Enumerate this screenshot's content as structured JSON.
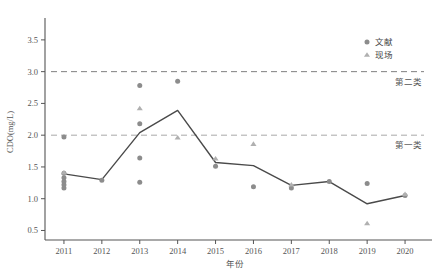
{
  "chart_data": {
    "type": "scatter",
    "title": "",
    "xlabel": "年份",
    "ylabel": "CDO(mg/L)",
    "categories": [
      "2011",
      "2012",
      "2013",
      "2014",
      "2015",
      "2016",
      "2017",
      "2018",
      "2019",
      "2020"
    ],
    "ylim": [
      0.35,
      3.75
    ],
    "yticks": [
      0.5,
      1.0,
      1.5,
      2.0,
      2.5,
      3.0,
      3.5
    ],
    "ytick_labels": [
      "0.5",
      "1.0",
      "1.5",
      "2.0",
      "2.5",
      "3.0",
      "3.5"
    ],
    "grid": false,
    "legend_position": "top-right",
    "series": [
      {
        "name": "文献",
        "marker": "circle",
        "color": "#8c8c8c",
        "points": [
          {
            "x": "2011",
            "y": 1.97
          },
          {
            "x": "2011",
            "y": 1.4
          },
          {
            "x": "2011",
            "y": 1.33
          },
          {
            "x": "2011",
            "y": 1.27
          },
          {
            "x": "2011",
            "y": 1.22
          },
          {
            "x": "2011",
            "y": 1.17
          },
          {
            "x": "2012",
            "y": 1.29
          },
          {
            "x": "2013",
            "y": 2.78
          },
          {
            "x": "2013",
            "y": 2.18
          },
          {
            "x": "2013",
            "y": 1.64
          },
          {
            "x": "2013",
            "y": 1.26
          },
          {
            "x": "2014",
            "y": 2.85
          },
          {
            "x": "2015",
            "y": 1.51
          },
          {
            "x": "2016",
            "y": 1.19
          },
          {
            "x": "2017",
            "y": 1.17
          },
          {
            "x": "2018",
            "y": 1.27
          },
          {
            "x": "2019",
            "y": 1.24
          },
          {
            "x": "2020",
            "y": 1.05
          }
        ]
      },
      {
        "name": "现场",
        "marker": "triangle",
        "color": "#b0b0b0",
        "points": [
          {
            "x": "2011",
            "y": 1.41
          },
          {
            "x": "2013",
            "y": 2.42
          },
          {
            "x": "2014",
            "y": 1.96
          },
          {
            "x": "2015",
            "y": 1.63
          },
          {
            "x": "2016",
            "y": 1.86
          },
          {
            "x": "2017",
            "y": 1.22
          },
          {
            "x": "2019",
            "y": 0.61
          },
          {
            "x": "2020",
            "y": 1.07
          }
        ]
      },
      {
        "name": "均值折线",
        "marker": "line",
        "color": "#4a4a4a",
        "values": [
          1.39,
          1.3,
          2.04,
          2.39,
          1.57,
          1.52,
          1.21,
          1.27,
          0.92,
          1.05
        ]
      }
    ],
    "reference_lines": [
      {
        "label": "第二类",
        "value": 3.0,
        "style": "dashed",
        "color": "#7f7f7f"
      },
      {
        "label": "第一类",
        "value": 2.0,
        "style": "dashed",
        "color": "#a8a8a8"
      }
    ]
  },
  "legend": {
    "items": [
      {
        "label": "文献",
        "marker": "circle"
      },
      {
        "label": "现场",
        "marker": "triangle"
      }
    ]
  },
  "axes": {
    "y_title": "CDO(mg/L)",
    "x_title": "年份",
    "y_tick_labels": [
      "3.5",
      "3.0",
      "2.5",
      "2.0",
      "1.5",
      "1.0",
      "0.5"
    ],
    "x_tick_labels": [
      "2011",
      "2012",
      "2013",
      "2014",
      "2015",
      "2016",
      "2017",
      "2018",
      "2019",
      "2020"
    ]
  }
}
